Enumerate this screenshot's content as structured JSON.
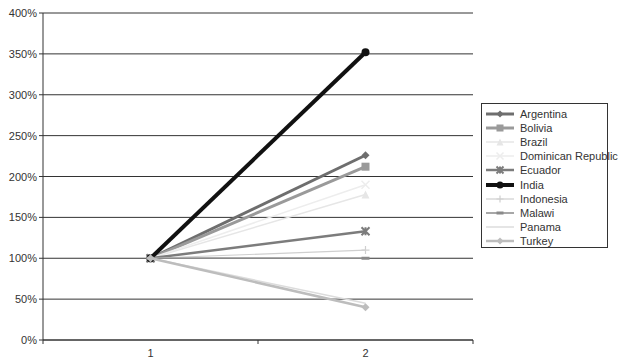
{
  "chart_data": {
    "type": "line",
    "title": "",
    "xlabel": "",
    "ylabel": "",
    "categories": [
      "1",
      "2"
    ],
    "ylim": [
      0,
      400
    ],
    "y_ticks": [
      "0%",
      "50%",
      "100%",
      "150%",
      "200%",
      "250%",
      "300%",
      "350%",
      "400%"
    ],
    "grid": true,
    "legend_position": "right",
    "series": [
      {
        "name": "Argentina",
        "values": [
          100,
          226
        ],
        "color": "#6e6e6e",
        "width": 3,
        "marker": "diamond"
      },
      {
        "name": "Bolivia",
        "values": [
          100,
          212
        ],
        "color": "#9a9a9a",
        "width": 3,
        "marker": "square"
      },
      {
        "name": "Brazil",
        "values": [
          100,
          178
        ],
        "color": "#e6e6e6",
        "width": 1.5,
        "marker": "triangle"
      },
      {
        "name": "Dominican Republic",
        "values": [
          100,
          190
        ],
        "color": "#ededed",
        "width": 1.5,
        "marker": "x"
      },
      {
        "name": "Ecuador",
        "values": [
          100,
          133
        ],
        "color": "#7c7c7c",
        "width": 2.5,
        "marker": "star"
      },
      {
        "name": "India",
        "values": [
          100,
          352
        ],
        "color": "#111111",
        "width": 4,
        "marker": "circle"
      },
      {
        "name": "Indonesia",
        "values": [
          100,
          110
        ],
        "color": "#cfcfcf",
        "width": 1.2,
        "marker": "plus"
      },
      {
        "name": "Malawi",
        "values": [
          100,
          100
        ],
        "color": "#8a8a8a",
        "width": 1.5,
        "marker": "dash"
      },
      {
        "name": "Panama",
        "values": [
          100,
          45
        ],
        "color": "#dcdcdc",
        "width": 1.5,
        "marker": "none"
      },
      {
        "name": "Turkey",
        "values": [
          100,
          40
        ],
        "color": "#bdbdbd",
        "width": 2.5,
        "marker": "diamond"
      }
    ]
  }
}
